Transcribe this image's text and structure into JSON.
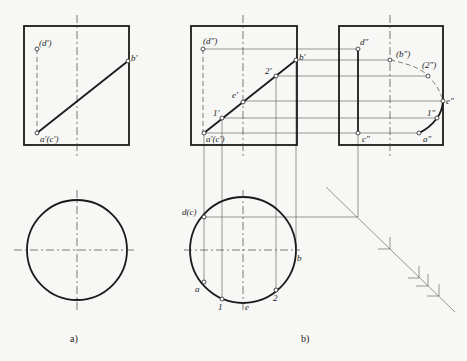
{
  "figure": {
    "captions": {
      "a": "a)",
      "b": "b)"
    },
    "view_a": {
      "front_labels": {
        "d": "(d′)",
        "b": "b′",
        "ac": "a′(c′)"
      }
    },
    "view_b": {
      "front_labels": {
        "d": "(d″)",
        "b": "b′",
        "two": "2′",
        "e": "e′",
        "one": "1′",
        "ac": "a′(c′)"
      },
      "side_labels": {
        "d": "d″",
        "b": "(b″)",
        "two": "(2″)",
        "e": "e″",
        "one": "1″",
        "a": "a″",
        "c": "c″"
      },
      "top_labels": {
        "dc": "d(c)",
        "b": "b",
        "a": "a",
        "one": "1",
        "e": "e",
        "two": "2"
      }
    }
  }
}
